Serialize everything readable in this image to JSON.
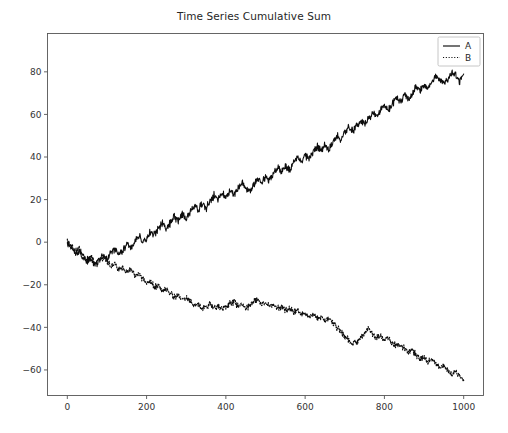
{
  "chart_data": {
    "type": "line",
    "title": "Time Series Cumulative Sum",
    "xlabel": "",
    "ylabel": "",
    "xlim": [
      -50,
      1050
    ],
    "ylim": [
      -72,
      98
    ],
    "xticks": [
      0,
      200,
      400,
      600,
      800,
      1000
    ],
    "yticks": [
      -60,
      -40,
      -20,
      0,
      20,
      40,
      60,
      80
    ],
    "xtick_labels": [
      "0",
      "200",
      "400",
      "600",
      "800",
      "1000"
    ],
    "ytick_labels": [
      "−60",
      "−40",
      "−20",
      "0",
      "20",
      "40",
      "60",
      "80"
    ],
    "grid": false,
    "legend_position": "upper right",
    "line_color": "#0d0d0d",
    "background_color": "#ffffff",
    "x_step": 10,
    "series": [
      {
        "name": "A",
        "style": "solid",
        "values": [
          0,
          -2,
          -5,
          -4,
          -7,
          -9,
          -8,
          -11,
          -9,
          -6,
          -8,
          -5,
          -3,
          -6,
          -4,
          -1,
          -3,
          1,
          3,
          0,
          2,
          5,
          4,
          7,
          9,
          6,
          9,
          12,
          10,
          13,
          11,
          14,
          17,
          15,
          18,
          16,
          19,
          22,
          20,
          23,
          21,
          24,
          22,
          25,
          28,
          26,
          24,
          27,
          30,
          28,
          31,
          29,
          32,
          35,
          33,
          36,
          34,
          37,
          40,
          38,
          41,
          39,
          42,
          45,
          43,
          46,
          44,
          47,
          50,
          48,
          51,
          54,
          52,
          55,
          57,
          55,
          58,
          61,
          59,
          62,
          64,
          62,
          65,
          68,
          66,
          69,
          67,
          70,
          73,
          71,
          74,
          72,
          75,
          78,
          76,
          74,
          77,
          80,
          78,
          75,
          79
        ]
      },
      {
        "name": "B",
        "style": "dotted",
        "values": [
          0,
          -2,
          -4,
          -3,
          -6,
          -8,
          -7,
          -10,
          -8,
          -7,
          -9,
          -11,
          -10,
          -13,
          -12,
          -14,
          -13,
          -16,
          -15,
          -17,
          -19,
          -18,
          -21,
          -20,
          -23,
          -22,
          -24,
          -26,
          -25,
          -27,
          -26,
          -28,
          -30,
          -29,
          -31,
          -30,
          -29,
          -31,
          -30,
          -32,
          -31,
          -29,
          -28,
          -30,
          -29,
          -31,
          -30,
          -28,
          -27,
          -29,
          -28,
          -30,
          -29,
          -31,
          -30,
          -32,
          -31,
          -33,
          -32,
          -34,
          -33,
          -35,
          -34,
          -36,
          -35,
          -37,
          -36,
          -38,
          -40,
          -42,
          -44,
          -46,
          -48,
          -47,
          -45,
          -43,
          -41,
          -43,
          -45,
          -44,
          -46,
          -45,
          -47,
          -49,
          -48,
          -50,
          -52,
          -51,
          -53,
          -55,
          -54,
          -56,
          -55,
          -57,
          -59,
          -58,
          -60,
          -62,
          -61,
          -63,
          -65
        ]
      }
    ],
    "series_a_detail": {
      "start": 0,
      "initial_dip": -11,
      "peak_value": 92,
      "peak_x": 750,
      "end_value": 57,
      "trend": "rising then declining"
    },
    "series_b_detail": {
      "start": 0,
      "plateau_value": -30,
      "plateau_range_x": [
        300,
        620
      ],
      "min_value": -66,
      "end_value": -65,
      "trend": "declining"
    }
  },
  "legend": {
    "entries": [
      {
        "label": "A",
        "style": "solid"
      },
      {
        "label": "B",
        "style": "dotted"
      }
    ]
  }
}
